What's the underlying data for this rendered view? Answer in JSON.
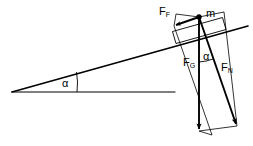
{
  "diagram": {
    "width": 253,
    "height": 146,
    "background_color": "#ffffff",
    "line_color": "#000000",
    "labels": {
      "friction_force": "F",
      "friction_force_sub": "F",
      "mass": "m",
      "gravity_force": "F",
      "gravity_force_sub": "G",
      "normal_force": "F",
      "normal_force_sub": "N",
      "incline_angle": "α",
      "force_angle": "α"
    },
    "elements": {
      "incline_surface": "incline-line",
      "ground_line": "horizontal-baseline",
      "block": "block-rectangle",
      "mass_point": "mass-point-dot",
      "angle_arc_incline": "incline-angle-arc",
      "angle_arc_forces": "force-angle-arc",
      "construction_lines": "parallelogram-construction"
    },
    "geometry": {
      "incline_apex": [
        12,
        92
      ],
      "incline_top_right": [
        248,
        26
      ],
      "baseline_start": [
        12,
        92
      ],
      "baseline_end": [
        175,
        92
      ],
      "mass_point": [
        199,
        17
      ],
      "gravity_tip": [
        199,
        131
      ],
      "normal_tip": [
        237,
        126
      ],
      "friction_tip": [
        174,
        26
      ]
    }
  }
}
